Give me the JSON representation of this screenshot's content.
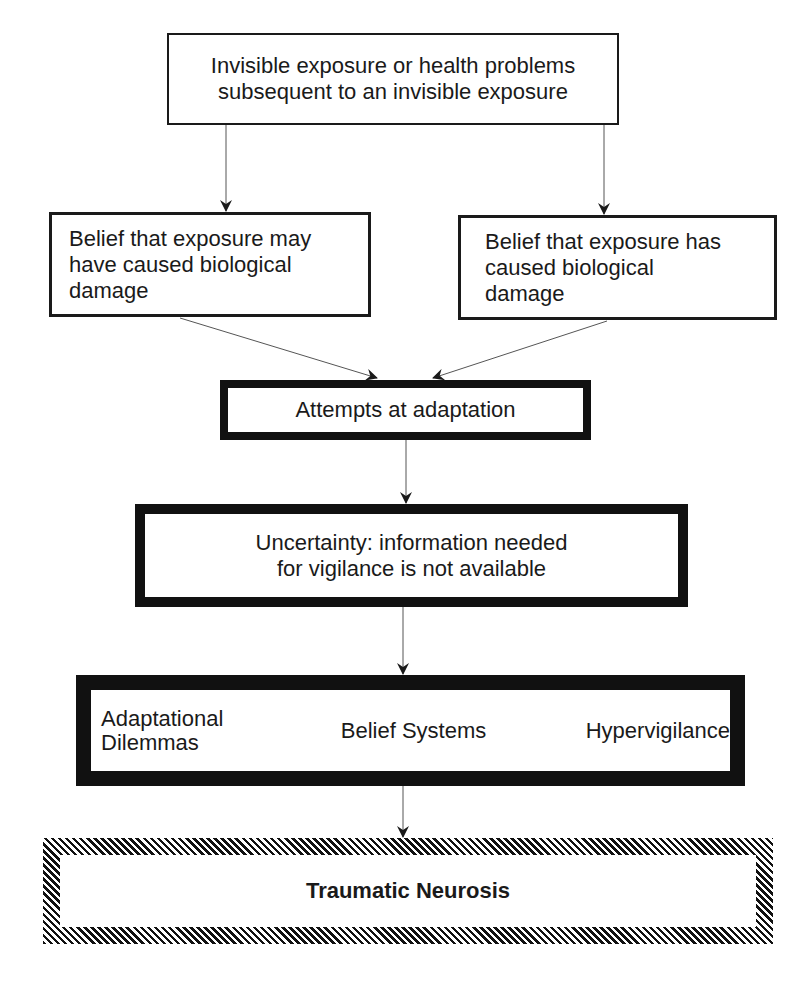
{
  "diagram": {
    "nodes": [
      {
        "id": "exposure",
        "text": "Invisible exposure or health problems\nsubsequent to an invisible exposure"
      },
      {
        "id": "belief-may",
        "text": "Belief that exposure may\nhave caused biological\ndamage"
      },
      {
        "id": "belief-has",
        "text": "Belief that exposure has\ncaused biological\ndamage"
      },
      {
        "id": "adaptation",
        "text": "Attempts at adaptation"
      },
      {
        "id": "uncertainty",
        "text": "Uncertainty: information needed\nfor vigilance is not available"
      },
      {
        "id": "outcomes",
        "items": [
          "Adaptational\nDilemmas",
          "Belief Systems",
          "Hypervigilance"
        ]
      },
      {
        "id": "neurosis",
        "text": "Traumatic Neurosis"
      }
    ],
    "edges": [
      {
        "from": "exposure",
        "to": "belief-may"
      },
      {
        "from": "exposure",
        "to": "belief-has"
      },
      {
        "from": "belief-may",
        "to": "adaptation"
      },
      {
        "from": "belief-has",
        "to": "adaptation"
      },
      {
        "from": "adaptation",
        "to": "uncertainty"
      },
      {
        "from": "uncertainty",
        "to": "outcomes"
      },
      {
        "from": "outcomes",
        "to": "neurosis"
      }
    ],
    "colors": {
      "stroke": "#1a1a1a",
      "background": "#ffffff"
    }
  }
}
